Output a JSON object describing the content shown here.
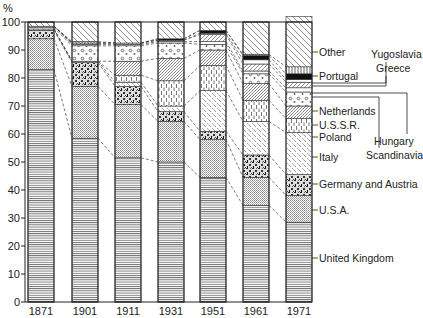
{
  "chart_data": {
    "type": "bar",
    "stacked": true,
    "title": "",
    "ylabel": "%",
    "xlabel": "",
    "ylim": [
      0,
      100
    ],
    "yticks": [
      0,
      10,
      20,
      30,
      40,
      50,
      60,
      70,
      80,
      90,
      100
    ],
    "categories": [
      "1871",
      "1901",
      "1911",
      "1931",
      "1951",
      "1961",
      "1971"
    ],
    "series": [
      {
        "name": "United Kingdom",
        "pattern": "hlines",
        "values": [
          83.0,
          58.5,
          51.5,
          50.0,
          44.5,
          34.5,
          28.5
        ]
      },
      {
        "name": "U.S.A.",
        "pattern": "dots",
        "values": [
          11.0,
          18.5,
          19.0,
          14.5,
          13.5,
          10.0,
          9.5
        ]
      },
      {
        "name": "Germany and Austria",
        "pattern": "speckle-dark",
        "values": [
          3.0,
          8.5,
          6.5,
          3.5,
          3.0,
          8.0,
          7.5
        ]
      },
      {
        "name": "Italy",
        "pattern": "stipple",
        "values": [
          0.5,
          0.5,
          1.5,
          2.0,
          14.5,
          12.0,
          15.0
        ]
      },
      {
        "name": "Poland",
        "pattern": "vdash",
        "values": [
          0.0,
          0.0,
          2.5,
          9.0,
          9.0,
          7.5,
          5.0
        ]
      },
      {
        "name": "U.S.S.R.",
        "pattern": "fine-stipple",
        "values": [
          0.0,
          0.0,
          5.0,
          8.0,
          5.5,
          6.0,
          4.5
        ]
      },
      {
        "name": "Netherlands",
        "pattern": "circles",
        "values": [
          0.5,
          5.5,
          5.5,
          5.5,
          2.0,
          3.5,
          5.0
        ]
      },
      {
        "name": "Scandinavia",
        "pattern": "empty",
        "values": [
          0.5,
          0.5,
          0.5,
          0.5,
          1.0,
          1.0,
          1.5
        ]
      },
      {
        "name": "Hungary",
        "pattern": "diag-light",
        "values": [
          0.0,
          0.5,
          0.5,
          0.5,
          2.5,
          2.5,
          2.0
        ]
      },
      {
        "name": "Yugoslavia",
        "pattern": "empty",
        "values": [
          0.0,
          0.0,
          0.0,
          0.0,
          0.5,
          1.5,
          1.0
        ]
      },
      {
        "name": "Greece",
        "pattern": "black",
        "values": [
          0.0,
          0.0,
          0.0,
          0.5,
          1.0,
          1.5,
          2.0
        ]
      },
      {
        "name": "Portugal",
        "pattern": "vlines",
        "values": [
          0.0,
          0.5,
          0.0,
          0.0,
          0.0,
          0.5,
          2.5
        ]
      },
      {
        "name": "Other",
        "pattern": "diag",
        "values": [
          1.5,
          7.0,
          7.5,
          6.0,
          3.0,
          11.5,
          18.0
        ]
      }
    ],
    "legend": {
      "position": "right",
      "labels": [
        {
          "text": "Other",
          "series": "Other"
        },
        {
          "text": "Portugal",
          "series": "Portugal"
        },
        {
          "text": "Yugoslavia",
          "series": "Yugoslavia"
        },
        {
          "text": "Greece",
          "series": "Greece"
        },
        {
          "text": "Netherlands",
          "series": "Netherlands"
        },
        {
          "text": "U.S.S.R.",
          "series": "U.S.S.R."
        },
        {
          "text": "Poland",
          "series": "Poland"
        },
        {
          "text": "Hungary",
          "series": "Hungary"
        },
        {
          "text": "Scandinavia",
          "series": "Scandinavia"
        },
        {
          "text": "Italy",
          "series": "Italy"
        },
        {
          "text": "Germany and Austria",
          "series": "Germany and Austria"
        },
        {
          "text": "U.S.A.",
          "series": "U.S.A."
        },
        {
          "text": "United Kingdom",
          "series": "United Kingdom"
        }
      ]
    },
    "grid": false
  },
  "axis": {
    "y_unit": "%",
    "y_tick_labels": [
      "0",
      "10",
      "20",
      "30",
      "40",
      "50",
      "60",
      "70",
      "80",
      "90",
      "100"
    ],
    "x_tick_labels": [
      "1871",
      "1901",
      "1911",
      "1931",
      "1951",
      "1961",
      "1971"
    ]
  },
  "legend_labels": {
    "other": "Other",
    "portugal": "Portugal",
    "yugoslavia": "Yugoslavia",
    "greece": "Greece",
    "netherlands": "Netherlands",
    "ussr": "U.S.S.R.",
    "poland": "Poland",
    "hungary": "Hungary",
    "scandinavia": "Scandinavia",
    "italy": "Italy",
    "germany": "Germany and Austria",
    "usa": "U.S.A.",
    "uk": "United Kingdom"
  }
}
